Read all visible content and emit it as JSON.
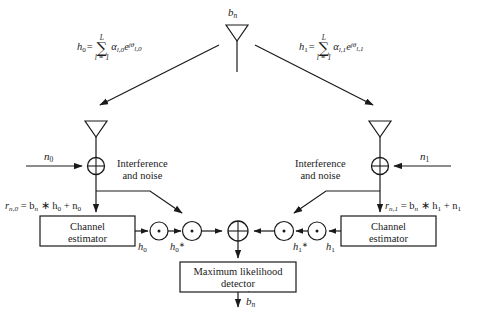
{
  "nodes": {
    "tx_antenna_label": "b",
    "tx_antenna_sub": "n",
    "rx0_noise_label": "n",
    "rx0_noise_sub": "0",
    "rx1_noise_label": "n",
    "rx1_noise_sub": "1",
    "interference_line1": "Interference",
    "interference_line2": "and noise",
    "channel_estimator_line1": "Channel",
    "channel_estimator_line2": "estimator",
    "ml_detector_line1": "Maximum likelihood",
    "ml_detector_line2": "detector",
    "output_label": "b",
    "output_sub": "n",
    "output_hat": "˙"
  },
  "equations": {
    "h0_lhs": "h",
    "h0_lhs_sub": "0",
    "h0_eq": "=",
    "h0_sum_upper": "L",
    "h0_sum_symbol": "∑",
    "h0_sum_lower": "l = 1",
    "h0_term_alpha": "α",
    "h0_term_alpha_sub": "l,0",
    "h0_term_e": "e",
    "h0_term_exp": "jθ",
    "h0_term_exp_sub": "l,0",
    "h0_full": "h0 = sum(l=1..L) alpha_{l,0} e^{j theta_{l,0}}",
    "h1_lhs": "h",
    "h1_lhs_sub": "1",
    "h1_eq": "=",
    "h1_sum_upper": "L",
    "h1_sum_symbol": "∑",
    "h1_sum_lower": "l = 1",
    "h1_term_alpha": "α",
    "h1_term_alpha_sub": "l,1",
    "h1_term_e": "e",
    "h1_term_exp": "jθ",
    "h1_term_exp_sub": "l,1",
    "h1_full": "h1 = sum(l=1..L) alpha_{l,1} e^{j theta_{l,1}}",
    "r0_lhs": "r",
    "r0_lhs_sub": "n,0",
    "r0_body": " = b",
    "r0_body_sub": "n",
    "r0_mid": " ∗ h",
    "r0_mid_sub": "0",
    "r0_tail": " + n",
    "r0_tail_sub": "0",
    "r0_full": "r_{n,0} = b_n * h_0 + n_0",
    "r1_lhs": "r",
    "r1_lhs_sub": "n,1",
    "r1_body": " = b",
    "r1_body_sub": "n",
    "r1_mid": " ∗ h",
    "r1_mid_sub": "1",
    "r1_tail": " + n",
    "r1_tail_sub": "1",
    "r1_full": "r_{n,1} = b_n * h_1 + n_1"
  },
  "signals": {
    "h0_est": "h",
    "h0_est_sub": "0",
    "h0_conj": "h",
    "h0_conj_sub": "0",
    "h0_conj_sup": "∗",
    "h1_est": "h",
    "h1_est_sub": "1",
    "h1_conj": "h",
    "h1_conj_sub": "1",
    "h1_conj_sup": "∗"
  },
  "operators": {
    "adder_symbol": "⊕",
    "conjugate_symbol": "∗",
    "multiplier_symbol": "·",
    "combiner_symbol": "⊕"
  },
  "colors": {
    "stroke": "#1a1a1a",
    "background": "#ffffff",
    "text": "#1a1a1a"
  }
}
